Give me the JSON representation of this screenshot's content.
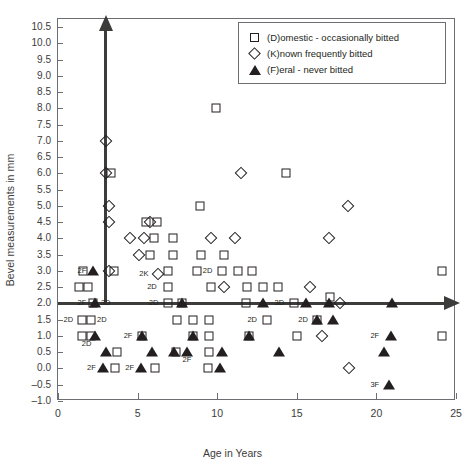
{
  "chart_data": {
    "type": "scatter",
    "title": "",
    "xlabel": "Age in Years",
    "ylabel": "Bevel measurements in mm",
    "xlim": [
      0,
      25
    ],
    "ylim": [
      -1.0,
      10.75
    ],
    "xticks": [
      "0",
      "5",
      "10",
      "15",
      "20",
      "25"
    ],
    "xtick_values": [
      0,
      5,
      10,
      15,
      20,
      25
    ],
    "yticks": [
      "10.5",
      "10.0",
      "9.5",
      "9.0",
      "8.5",
      "8.0",
      "7.5",
      "7.0",
      "6.5",
      "6.0",
      "5.5",
      "5.0",
      "4.5",
      "4.0",
      "3.5",
      "3.0",
      "2.5",
      "2.0",
      "1.5",
      "1.0",
      "0.5",
      "0.0",
      "-0.5",
      "-1.0"
    ],
    "ytick_values": [
      10.5,
      10.0,
      9.5,
      9.0,
      8.5,
      8.0,
      7.5,
      7.0,
      6.5,
      6.0,
      5.5,
      5.0,
      4.5,
      4.0,
      3.5,
      3.0,
      2.5,
      2.0,
      1.5,
      1.0,
      0.5,
      0.0,
      -0.5,
      -1.0
    ],
    "grid": false,
    "legend_position": "top-right",
    "marker_color": "#231f20",
    "axis_color": "#3c3c3b",
    "internal_axes": {
      "vertical_at_x": 3.0,
      "vertical_top_y": 10.4,
      "vertical_bottom_y": 2.0,
      "horizontal_at_y": 2.0,
      "horizontal_left_x": 0.0,
      "horizontal_right_x": 24.3
    },
    "series": [
      {
        "name": "(D)omestic - occasionally bitted",
        "marker": "square",
        "points": [
          {
            "x": 3.35,
            "y": 6.0
          },
          {
            "x": 12.0,
            "y": 10.0
          },
          {
            "x": 9.9,
            "y": 8.0
          },
          {
            "x": 14.3,
            "y": 6.0
          },
          {
            "x": 5.5,
            "y": 4.5
          },
          {
            "x": 6.2,
            "y": 4.5
          },
          {
            "x": 8.9,
            "y": 5.0
          },
          {
            "x": 6.0,
            "y": 4.0
          },
          {
            "x": 7.2,
            "y": 4.0
          },
          {
            "x": 1.6,
            "y": 3.0
          },
          {
            "x": 3.5,
            "y": 3.0
          },
          {
            "x": 5.8,
            "y": 3.5
          },
          {
            "x": 7.2,
            "y": 3.5
          },
          {
            "x": 9.0,
            "y": 3.5
          },
          {
            "x": 10.4,
            "y": 3.5
          },
          {
            "x": 6.9,
            "y": 3.0
          },
          {
            "x": 8.7,
            "y": 3.0
          },
          {
            "x": 10.3,
            "y": 3.0
          },
          {
            "x": 11.3,
            "y": 3.0
          },
          {
            "x": 12.2,
            "y": 3.0
          },
          {
            "x": 24.1,
            "y": 3.0
          },
          {
            "x": 1.3,
            "y": 2.5
          },
          {
            "x": 1.9,
            "y": 2.5
          },
          {
            "x": 6.9,
            "y": 2.5
          },
          {
            "x": 9.6,
            "y": 2.5
          },
          {
            "x": 11.9,
            "y": 2.5
          },
          {
            "x": 12.9,
            "y": 2.5
          },
          {
            "x": 13.8,
            "y": 2.5
          },
          {
            "x": 2.2,
            "y": 2.0
          },
          {
            "x": 6.9,
            "y": 2.0
          },
          {
            "x": 7.8,
            "y": 2.0
          },
          {
            "x": 11.8,
            "y": 2.0
          },
          {
            "x": 14.8,
            "y": 2.0
          },
          {
            "x": 17.1,
            "y": 2.2
          },
          {
            "x": 1.5,
            "y": 1.5
          },
          {
            "x": 2.1,
            "y": 1.5
          },
          {
            "x": 7.5,
            "y": 1.5
          },
          {
            "x": 8.5,
            "y": 1.5
          },
          {
            "x": 9.5,
            "y": 1.5
          },
          {
            "x": 13.1,
            "y": 1.5
          },
          {
            "x": 16.3,
            "y": 1.5
          },
          {
            "x": 1.5,
            "y": 1.0
          },
          {
            "x": 2.1,
            "y": 1.0
          },
          {
            "x": 5.3,
            "y": 1.0
          },
          {
            "x": 8.5,
            "y": 1.0
          },
          {
            "x": 9.5,
            "y": 1.0
          },
          {
            "x": 12.0,
            "y": 1.0
          },
          {
            "x": 15.0,
            "y": 1.0
          },
          {
            "x": 24.1,
            "y": 1.0
          },
          {
            "x": 3.7,
            "y": 0.5
          },
          {
            "x": 7.4,
            "y": 0.5
          },
          {
            "x": 9.5,
            "y": 0.5
          },
          {
            "x": 3.6,
            "y": 0.0
          },
          {
            "x": 6.1,
            "y": 0.0
          },
          {
            "x": 9.4,
            "y": 0.0
          }
        ]
      },
      {
        "name": "(K)nown frequently bitted",
        "marker": "diamond",
        "points": [
          {
            "x": 3.0,
            "y": 7.0
          },
          {
            "x": 3.0,
            "y": 6.0
          },
          {
            "x": 11.5,
            "y": 6.0
          },
          {
            "x": 3.2,
            "y": 5.0
          },
          {
            "x": 3.2,
            "y": 4.5
          },
          {
            "x": 5.8,
            "y": 4.5
          },
          {
            "x": 18.2,
            "y": 5.0
          },
          {
            "x": 4.5,
            "y": 4.0
          },
          {
            "x": 5.4,
            "y": 4.0
          },
          {
            "x": 9.6,
            "y": 4.0
          },
          {
            "x": 11.1,
            "y": 4.0
          },
          {
            "x": 17.0,
            "y": 4.0
          },
          {
            "x": 5.1,
            "y": 3.5
          },
          {
            "x": 3.2,
            "y": 3.0
          },
          {
            "x": 6.3,
            "y": 2.9
          },
          {
            "x": 10.4,
            "y": 2.5
          },
          {
            "x": 15.8,
            "y": 2.5
          },
          {
            "x": 17.7,
            "y": 2.0
          },
          {
            "x": 16.6,
            "y": 1.0
          },
          {
            "x": 18.3,
            "y": 0.0
          }
        ]
      },
      {
        "name": "(F)eral - never bitted",
        "marker": "triangle",
        "points": [
          {
            "x": 2.2,
            "y": 3.0
          },
          {
            "x": 2.3,
            "y": 2.0
          },
          {
            "x": 7.8,
            "y": 2.0
          },
          {
            "x": 12.9,
            "y": 2.0
          },
          {
            "x": 15.6,
            "y": 2.0
          },
          {
            "x": 17.0,
            "y": 2.0
          },
          {
            "x": 21.0,
            "y": 2.0
          },
          {
            "x": 16.3,
            "y": 1.5
          },
          {
            "x": 17.3,
            "y": 1.5
          },
          {
            "x": 2.3,
            "y": 1.0
          },
          {
            "x": 5.3,
            "y": 1.0
          },
          {
            "x": 8.5,
            "y": 1.0
          },
          {
            "x": 12.0,
            "y": 1.0
          },
          {
            "x": 20.9,
            "y": 1.0
          },
          {
            "x": 3.0,
            "y": 0.5
          },
          {
            "x": 5.9,
            "y": 0.5
          },
          {
            "x": 7.3,
            "y": 0.5
          },
          {
            "x": 8.1,
            "y": 0.5
          },
          {
            "x": 10.3,
            "y": 0.5
          },
          {
            "x": 13.9,
            "y": 0.5
          },
          {
            "x": 20.5,
            "y": 0.5
          },
          {
            "x": 2.8,
            "y": 0.0
          },
          {
            "x": 5.2,
            "y": 0.0
          },
          {
            "x": 10.2,
            "y": 0.0
          },
          {
            "x": 20.8,
            "y": -0.5
          }
        ]
      }
    ],
    "annotations": [
      {
        "text": "2F",
        "x": 1.5,
        "y": 3.0
      },
      {
        "text": "2K",
        "x": 5.4,
        "y": 2.9
      },
      {
        "text": "2D",
        "x": 9.4,
        "y": 3.0
      },
      {
        "text": "2D",
        "x": 5.9,
        "y": 2.5
      },
      {
        "text": "2F",
        "x": 1.5,
        "y": 2.0
      },
      {
        "text": "3D",
        "x": 3.0,
        "y": 2.0
      },
      {
        "text": "2D",
        "x": 6.0,
        "y": 2.0
      },
      {
        "text": "3D",
        "x": 13.9,
        "y": 2.0
      },
      {
        "text": "2D",
        "x": 0.65,
        "y": 1.5
      },
      {
        "text": "2D",
        "x": 2.75,
        "y": 1.5
      },
      {
        "text": "2D",
        "x": 12.2,
        "y": 1.5
      },
      {
        "text": "2D",
        "x": 15.4,
        "y": 1.5
      },
      {
        "text": "2D",
        "x": 1.8,
        "y": 0.75
      },
      {
        "text": "2F",
        "x": 4.4,
        "y": 1.0
      },
      {
        "text": "2F",
        "x": 19.9,
        "y": 1.0
      },
      {
        "text": "2F",
        "x": 8.1,
        "y": 0.25
      },
      {
        "text": "2F",
        "x": 2.1,
        "y": 0.0
      },
      {
        "text": "2F",
        "x": 4.5,
        "y": 0.0
      },
      {
        "text": "3F",
        "x": 19.9,
        "y": -0.5
      }
    ],
    "overlap_markers": [
      {
        "x": 3.0,
        "y": 7.0,
        "shapes": [
          "diamond",
          "square"
        ],
        "note": "overlapping rosette"
      },
      {
        "x": 3.0,
        "y": 6.0,
        "shapes": [
          "diamond",
          "square"
        ],
        "note": "overlapping rosette"
      },
      {
        "x": 3.2,
        "y": 5.0,
        "shapes": [
          "diamond",
          "square"
        ],
        "note": "overlapping rosette"
      },
      {
        "x": 11.5,
        "y": 6.0,
        "shapes": [
          "diamond",
          "square"
        ],
        "note": "overlapping rosette"
      },
      {
        "x": 5.3,
        "y": 1.0,
        "shapes": [
          "square",
          "triangle"
        ]
      },
      {
        "x": 8.5,
        "y": 1.0,
        "shapes": [
          "square",
          "triangle"
        ]
      },
      {
        "x": 12.0,
        "y": 1.0,
        "shapes": [
          "square",
          "triangle"
        ]
      },
      {
        "x": 16.6,
        "y": 1.0,
        "shapes": [
          "diamond",
          "square"
        ],
        "note": "overlapping rosette"
      },
      {
        "x": 2.3,
        "y": 2.0,
        "shapes": [
          "square",
          "triangle"
        ]
      },
      {
        "x": 2.2,
        "y": 3.0,
        "shapes": [
          "square",
          "triangle"
        ]
      },
      {
        "x": 7.8,
        "y": 2.0,
        "shapes": [
          "square",
          "triangle"
        ]
      },
      {
        "x": 16.3,
        "y": 1.5,
        "shapes": [
          "square",
          "triangle"
        ]
      },
      {
        "x": 2.3,
        "y": 1.0,
        "shapes": [
          "square",
          "triangle"
        ]
      }
    ]
  },
  "legend": {
    "items": [
      {
        "symbol": "square",
        "label": "(D)omestic - occasionally bitted"
      },
      {
        "symbol": "diamond",
        "label": "(K)nown frequently bitted"
      },
      {
        "symbol": "triangle",
        "label": "(F)eral - never bitted"
      }
    ]
  }
}
